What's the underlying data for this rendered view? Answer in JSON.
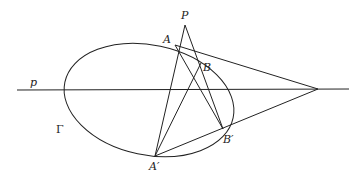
{
  "diagram": {
    "type": "projective-geometry-construction",
    "labels": {
      "P": "P",
      "A": "A",
      "B": "B",
      "A_prime": "A′",
      "B_prime": "B′",
      "line_p": "p",
      "conic": "Γ"
    },
    "stroke_color": "#222222",
    "background": "#ffffff"
  }
}
